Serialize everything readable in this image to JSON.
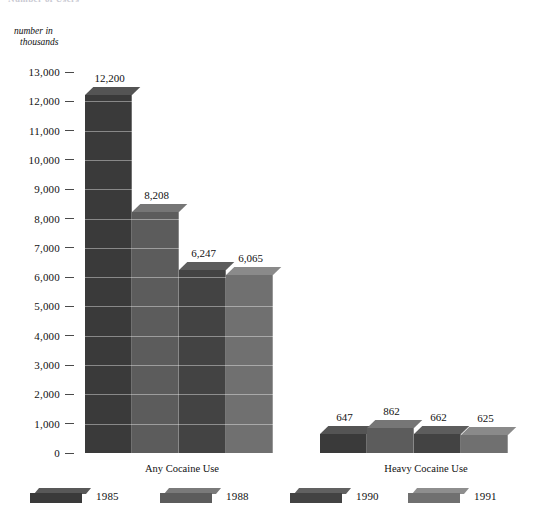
{
  "chart_title": "Number of Users",
  "axis_caption": {
    "line1": "number in",
    "line2": "thousands"
  },
  "chart_data": {
    "type": "bar",
    "title": "Number of Users",
    "xlabel": "",
    "ylabel": "number in thousands",
    "ylim": [
      0,
      13000
    ],
    "grid": true,
    "legend_position": "bottom",
    "categories": [
      "Any Cocaine Use",
      "Heavy Cocaine Use"
    ],
    "ytick_labels": [
      "13,000",
      "12,000",
      "11,000",
      "10,000",
      "9,000",
      "8,000",
      "7,000",
      "6,000",
      "5,000",
      "4,000",
      "3,000",
      "2,000",
      "1,000",
      "0"
    ],
    "ytick_values": [
      13000,
      12000,
      11000,
      10000,
      9000,
      8000,
      7000,
      6000,
      5000,
      4000,
      3000,
      2000,
      1000,
      0
    ],
    "series": [
      {
        "name": "1985",
        "color": "#3a3a3a",
        "values": [
          12200,
          647
        ],
        "labels": [
          "12,200",
          "647"
        ]
      },
      {
        "name": "1988",
        "color": "#5c5c5c",
        "values": [
          8208,
          862
        ],
        "labels": [
          "8,208",
          "862"
        ]
      },
      {
        "name": "1990",
        "color": "#434343",
        "values": [
          6247,
          662
        ],
        "labels": [
          "6,247",
          "662"
        ]
      },
      {
        "name": "1991",
        "color": "#707070",
        "values": [
          6065,
          625
        ],
        "labels": [
          "6,065",
          "625"
        ]
      }
    ]
  },
  "legend": {
    "items": [
      {
        "label": "1985",
        "color": "#3a3a3a"
      },
      {
        "label": "1988",
        "color": "#5c5c5c"
      },
      {
        "label": "1990",
        "color": "#434343"
      },
      {
        "label": "1991",
        "color": "#707070"
      }
    ]
  }
}
